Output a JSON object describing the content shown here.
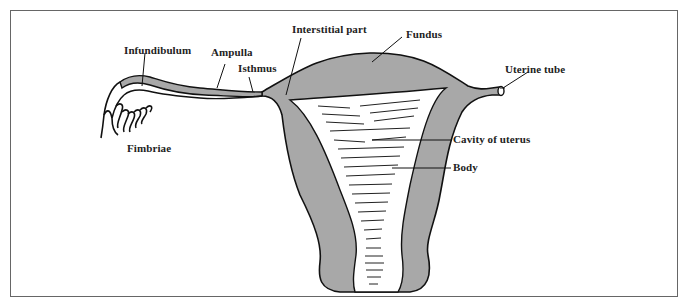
{
  "diagram": {
    "colors": {
      "tissue": "#a8a8a8",
      "outline": "#111111",
      "frame": "#666666",
      "background": "#ffffff"
    },
    "labels": {
      "infundibulum": "Infundibulum",
      "ampulla": "Ampulla",
      "isthmus": "Isthmus",
      "interstitial": "Interstitial part",
      "fundus": "Fundus",
      "uterine_tube": "Uterine tube",
      "cavity": "Cavity of uterus",
      "body": "Body",
      "fimbriae": "Fimbriae"
    }
  }
}
